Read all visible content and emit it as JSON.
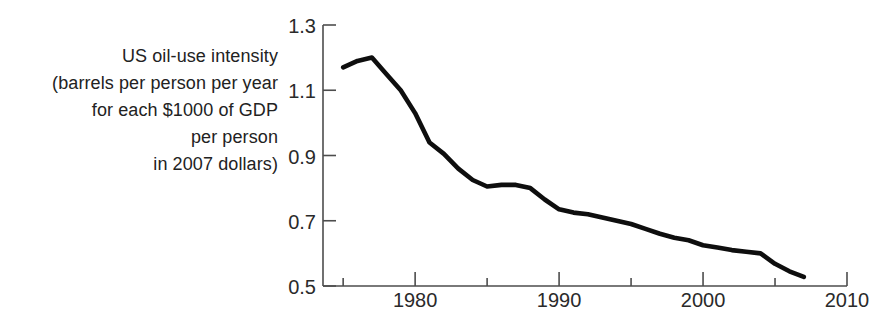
{
  "figure": {
    "label_lines": [
      "US oil-use intensity",
      "(barrels per person per year",
      "for each $1000 of GDP",
      "per person",
      "in 2007 dollars)"
    ]
  },
  "chart_data": {
    "type": "line",
    "title": "US oil-use intensity (barrels per person per year for each $1000 of GDP per person in 2007 dollars)",
    "xlabel": "",
    "ylabel": "US oil-use intensity (barrels per person per year for each $1000 of GDP per person in 2007 dollars)",
    "series": [
      {
        "name": "US oil-use intensity",
        "x": [
          1975,
          1976,
          1977,
          1978,
          1979,
          1980,
          1981,
          1982,
          1983,
          1984,
          1985,
          1986,
          1987,
          1988,
          1989,
          1990,
          1991,
          1992,
          1993,
          1994,
          1995,
          1996,
          1997,
          1998,
          1999,
          2000,
          2001,
          2002,
          2003,
          2004,
          2005,
          2006,
          2007
        ],
        "values": [
          1.17,
          1.19,
          1.2,
          1.15,
          1.1,
          1.03,
          0.94,
          0.905,
          0.86,
          0.825,
          0.805,
          0.81,
          0.81,
          0.8,
          0.765,
          0.735,
          0.725,
          0.72,
          0.71,
          0.7,
          0.69,
          0.675,
          0.66,
          0.648,
          0.64,
          0.625,
          0.618,
          0.61,
          0.605,
          0.6,
          0.568,
          0.545,
          0.528
        ]
      }
    ],
    "xlim": [
      1973.6,
      2010
    ],
    "ylim": [
      0.5,
      1.3
    ],
    "x_major_ticks": [
      1980,
      1990,
      2000,
      2010
    ],
    "x_major_tick_labels": [
      "1980",
      "1990",
      "2000",
      "2010"
    ],
    "x_minor_ticks": [
      1975,
      1985,
      1995,
      2005
    ],
    "y_ticks": [
      0.5,
      0.7,
      0.9,
      1.1,
      1.3
    ],
    "y_tick_labels": [
      "0.5",
      "0.7",
      "0.9",
      "1.1",
      "1.3"
    ],
    "grid": false,
    "legend": false,
    "colors": {
      "line": "#0e0e0e",
      "axis": "#4d4d4d",
      "tick_text": "#2a2a2a",
      "background": "#ffffff"
    }
  }
}
